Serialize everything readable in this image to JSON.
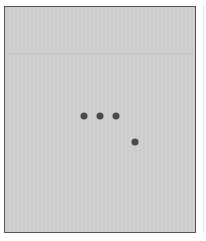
{
  "panel": {
    "background": "#cfcfcf",
    "border_color": "#555555",
    "loading_indicator": {
      "icon": "ellipsis-dots-icon",
      "dot_color": "#4a4a4a",
      "dots": [
        {
          "x": 84,
          "y": 116
        },
        {
          "x": 100,
          "y": 116
        },
        {
          "x": 116,
          "y": 116
        },
        {
          "x": 135,
          "y": 142
        }
      ]
    }
  }
}
